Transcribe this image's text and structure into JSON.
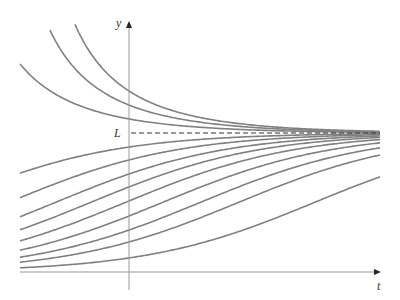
{
  "chart_data": {
    "type": "line",
    "title": "",
    "xlabel": "t",
    "ylabel": "y",
    "annotations": [
      {
        "text": "L",
        "meaning": "equilibrium / carrying capacity",
        "style": "dashed horizontal line"
      }
    ],
    "grid": false,
    "legend": null,
    "model": "logistic family y(t) = L / (1 + C·e^(-k t))",
    "L": 1.0,
    "k_per_px": 0.0118,
    "ylim": [
      0,
      1.8
    ],
    "series": [
      {
        "name": "above L #1",
        "y_at_t0": 1.302,
        "x_start_px": 75
      },
      {
        "name": "above L #2",
        "y_at_t0": 1.201,
        "x_start_px": 50
      },
      {
        "name": "above L #3",
        "y_at_t0": 1.101,
        "x_start_px": 20
      },
      {
        "name": "below L #1",
        "y_at_t0": 0.899,
        "x_start_px": 20
      },
      {
        "name": "below L #2",
        "y_at_t0": 0.806,
        "x_start_px": 20
      },
      {
        "name": "below L #3",
        "y_at_t0": 0.705,
        "x_start_px": 20
      },
      {
        "name": "below L #4",
        "y_at_t0": 0.612,
        "x_start_px": 20
      },
      {
        "name": "below L #5",
        "y_at_t0": 0.511,
        "x_start_px": 20
      },
      {
        "name": "below L #6",
        "y_at_t0": 0.403,
        "x_start_px": 20
      },
      {
        "name": "below L #7",
        "y_at_t0": 0.302,
        "x_start_px": 20
      },
      {
        "name": "below L #8",
        "y_at_t0": 0.216,
        "x_start_px": 20
      },
      {
        "name": "below L #9",
        "y_at_t0": 0.101,
        "x_start_px": 20
      }
    ]
  },
  "labels": {
    "y_axis": "y",
    "t_axis": "t",
    "L": "L"
  },
  "colors": {
    "curve": "#808080",
    "axis": "#999999",
    "dash": "#333333"
  }
}
